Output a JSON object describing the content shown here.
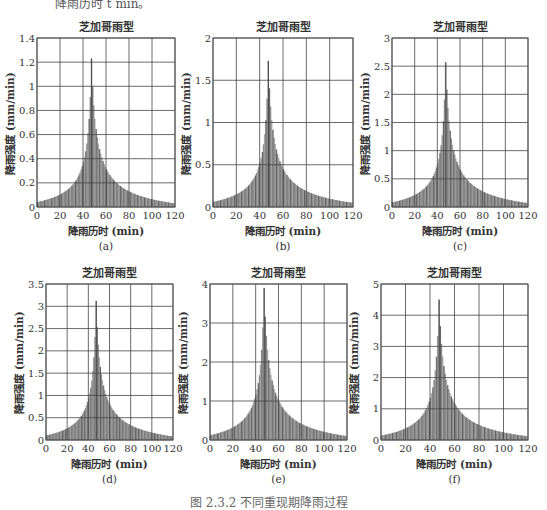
{
  "page": {
    "top_text": "降雨历时 t min。",
    "bottom_caption": "图 2.3.2 不同重现期降雨过程"
  },
  "chart_data": [
    {
      "id": "a",
      "type": "bar",
      "title": "芝加哥雨型",
      "xlabel": "降雨历时 (min)",
      "ylabel": "降雨强度 (mm/min)",
      "sublabel": "(a)",
      "xlim": [
        0,
        120
      ],
      "ylim": [
        0,
        1.4
      ],
      "xticks": [
        0,
        20,
        40,
        60,
        80,
        100,
        120
      ],
      "yticks": [
        0,
        0.2,
        0.4,
        0.6,
        0.8,
        1,
        1.2,
        1.4
      ],
      "ytick_labels": [
        "0",
        "0.2",
        "0.4",
        "0.6",
        "0.8",
        "1",
        "1.2",
        "1.4"
      ],
      "grid": true,
      "peak_time": 47.5,
      "peak_value": 1.23,
      "start_value": 0.04,
      "end_value": 0.03
    },
    {
      "id": "b",
      "type": "bar",
      "title": "芝加哥雨型",
      "xlabel": "降雨历时 (min)",
      "ylabel": "降雨强度 (mm/min)",
      "sublabel": "(b)",
      "xlim": [
        0,
        120
      ],
      "ylim": [
        0,
        2
      ],
      "xticks": [
        0,
        20,
        40,
        60,
        80,
        100,
        120
      ],
      "yticks": [
        0,
        0.5,
        1,
        1.5,
        2
      ],
      "ytick_labels": [
        "0",
        "0.5",
        "1",
        "1.5",
        "2"
      ],
      "grid": true,
      "peak_time": 47.5,
      "peak_value": 1.73,
      "start_value": 0.06,
      "end_value": 0.05
    },
    {
      "id": "c",
      "type": "bar",
      "title": "芝加哥雨型",
      "xlabel": "降雨历时 (min)",
      "ylabel": "降雨强度 (mm/min)",
      "sublabel": "(c)",
      "xlim": [
        0,
        120
      ],
      "ylim": [
        0,
        3
      ],
      "xticks": [
        0,
        20,
        40,
        60,
        80,
        100,
        120
      ],
      "yticks": [
        0,
        0.5,
        1,
        1.5,
        2,
        2.5,
        3
      ],
      "ytick_labels": [
        "0",
        "0.5",
        "1",
        "1.5",
        "2",
        "2.5",
        "3"
      ],
      "grid": true,
      "peak_time": 47.5,
      "peak_value": 2.57,
      "start_value": 0.08,
      "end_value": 0.07
    },
    {
      "id": "d",
      "type": "bar",
      "title": "芝加哥雨型",
      "xlabel": "降雨历时 (min)",
      "ylabel": "降雨强度 (mm/min)",
      "sublabel": "(d)",
      "xlim": [
        0,
        120
      ],
      "ylim": [
        0,
        3.5
      ],
      "xticks": [
        0,
        20,
        40,
        60,
        80,
        100,
        120
      ],
      "yticks": [
        0,
        0.5,
        1,
        1.5,
        2,
        2.5,
        3,
        3.5
      ],
      "ytick_labels": [
        "0",
        "0.5",
        "1",
        "1.5",
        "2",
        "2.5",
        "3",
        "3.5"
      ],
      "grid": true,
      "peak_time": 47.5,
      "peak_value": 3.12,
      "start_value": 0.1,
      "end_value": 0.08
    },
    {
      "id": "e",
      "type": "bar",
      "title": "芝加哥雨型",
      "xlabel": "降雨历时 (min)",
      "ylabel": "降雨强度 (mm/min)",
      "sublabel": "(e)",
      "xlim": [
        0,
        120
      ],
      "ylim": [
        0,
        4
      ],
      "xticks": [
        0,
        20,
        40,
        60,
        80,
        100,
        120
      ],
      "yticks": [
        0,
        1,
        2,
        3,
        4
      ],
      "ytick_labels": [
        "0",
        "1",
        "2",
        "3",
        "4"
      ],
      "grid": true,
      "peak_time": 47.5,
      "peak_value": 3.9,
      "start_value": 0.12,
      "end_value": 0.1
    },
    {
      "id": "f",
      "type": "bar",
      "title": "芝加哥雨型",
      "xlabel": "降雨历时 (min)",
      "ylabel": "降雨强度 (mm/min)",
      "sublabel": "(f)",
      "xlim": [
        0,
        120
      ],
      "ylim": [
        0,
        5
      ],
      "xticks": [
        0,
        20,
        40,
        60,
        80,
        100,
        120
      ],
      "yticks": [
        0,
        1,
        2,
        3,
        4,
        5
      ],
      "ytick_labels": [
        "0",
        "1",
        "2",
        "3",
        "4",
        "5"
      ],
      "grid": true,
      "peak_time": 47.5,
      "peak_value": 4.5,
      "start_value": 0.14,
      "end_value": 0.12
    }
  ]
}
